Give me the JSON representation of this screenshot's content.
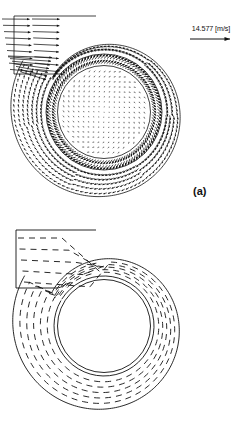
{
  "figure": {
    "background_color": "#ffffff",
    "line_color": "#111111",
    "panels": [
      {
        "id": "a",
        "label": "(a)",
        "content": "velocity vector field in centrifugal fan volute with impeller",
        "plot_type": "vector-field"
      },
      {
        "id": "b",
        "label": "(b)",
        "content": "streamline / particle path plot in centrifugal fan volute",
        "plot_type": "streamlines"
      }
    ]
  },
  "legend": {
    "value": "14.577",
    "unit": "[m/s]",
    "text": "14.577 [m/s]",
    "arrow_icon": "right-arrow-icon",
    "description": "reference velocity vector scale"
  },
  "chart_data": {
    "type": "scatter",
    "title": "",
    "subtitle": "",
    "xlabel": "",
    "ylabel": "",
    "grid": false,
    "legend_position": "top-right",
    "annotations": [
      "14.577 [m/s]",
      "(a)",
      "(b)"
    ],
    "panels": [
      {
        "name": "(a) velocity vectors",
        "type": "vector-field",
        "reference_vector_magnitude": 14.577,
        "reference_vector_unit": "m/s",
        "geometry": {
          "impeller_center": [
            104,
            112
          ],
          "impeller_radius": 45,
          "blade_ring_inner_radius": 47,
          "blade_ring_outer_radius": 58,
          "volute_outer_start_radius": 62,
          "volute_outer_end_radius": 96,
          "inlet_duct": {
            "x0": 10,
            "y0": 14,
            "x1": 96,
            "y1": 72
          }
        },
        "field": {
          "inlet_rows": 9,
          "inlet_vector_mean_magnitude": 13.5,
          "impeller_vector_mean_magnitude": 2.0,
          "volute_vector_mean_magnitude": 7.5,
          "rotation_sense": "clockwise"
        }
      },
      {
        "name": "(b) streamlines",
        "type": "line",
        "geometry": {
          "impeller_center": [
            104,
            112
          ],
          "hub_radius": 46,
          "volute_inner_radius": 50,
          "volute_outer_start_radius": 62,
          "volute_outer_end_radius": 94,
          "inlet_duct": {
            "x0": 12,
            "y0": 16,
            "x1": 96,
            "y1": 74
          }
        },
        "streamline_count": 5,
        "dash_pattern": "6 5"
      }
    ]
  }
}
